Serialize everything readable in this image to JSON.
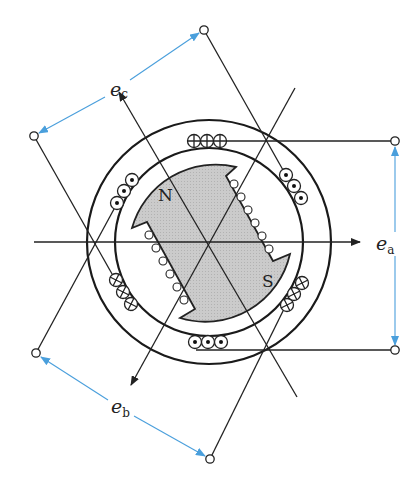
{
  "figure": {
    "type": "three-phase synchronous generator cross-section",
    "labels": {
      "ea": {
        "main": "e",
        "sub": "a"
      },
      "eb": {
        "main": "e",
        "sub": "b"
      },
      "ec": {
        "main": "e",
        "sub": "c"
      },
      "north_pole": "N",
      "south_pole": "S"
    },
    "colors": {
      "line": "#222222",
      "voltage_arrow": "#4a9fdc",
      "rotor_fill": "#c8c8c8",
      "background": "#ffffff"
    },
    "coil_groups": [
      {
        "position": "top",
        "symbol": "cross",
        "count": 3
      },
      {
        "position": "bottom",
        "symbol": "dot",
        "count": 3
      },
      {
        "position": "upper-right",
        "symbol": "dot",
        "count": 3
      },
      {
        "position": "lower-right",
        "symbol": "cross",
        "count": 3
      },
      {
        "position": "upper-left",
        "symbol": "dot",
        "count": 3
      },
      {
        "position": "lower-left",
        "symbol": "cross",
        "count": 3
      }
    ],
    "terminals": 6
  }
}
